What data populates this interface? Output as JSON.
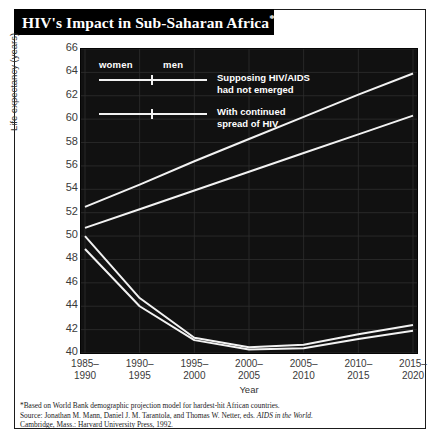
{
  "title": {
    "text": "HIV's Impact in Sub-Saharan Africa",
    "footnote_marker": "*"
  },
  "legend": {
    "col_women": "women",
    "col_men": "men",
    "series_a_label": "Supposing HIV/AIDS\nhad not emerged",
    "series_b_label": "With continued\nspread of HIV"
  },
  "notes": {
    "line1": "*Based on World Bank demographic projection model for hardest-hit African countries.",
    "line2_prefix": "Source: Jonathan M. Mann, Daniel J. M. Tarantola, and Thomas W. Netter, eds. ",
    "line2_italic": "AIDS in the World.",
    "line3": "Cambridge, Mass.: Harvard University Press, 1992."
  },
  "chart_data": {
    "type": "line",
    "title": "HIV's Impact in Sub-Saharan Africa",
    "xlabel": "Year",
    "ylabel": "Life expectancy (years)",
    "categories": [
      "1985–\n1990",
      "1990–\n1995",
      "1995–\n2000",
      "2000–\n2005",
      "2005–\n2010",
      "2010–\n2015",
      "2015–\n2020"
    ],
    "categories_flat": [
      "1985-1990",
      "1990-1995",
      "1995-2000",
      "2000-2005",
      "2005-2010",
      "2010-2015",
      "2015-2020"
    ],
    "ylim": [
      40,
      66
    ],
    "ytick_step": 2,
    "yticks": [
      66,
      64,
      62,
      60,
      58,
      56,
      54,
      52,
      50,
      48,
      46,
      44,
      42,
      40
    ],
    "grid": true,
    "legend_position": "top-left-inside",
    "line_color": "#f2f2f2",
    "plot_background": "#111111",
    "series": [
      {
        "name": "women, supposing HIV/AIDS had not emerged",
        "values": [
          52.5,
          54.4,
          56.4,
          58.3,
          60.2,
          62.1,
          63.9
        ]
      },
      {
        "name": "men, supposing HIV/AIDS had not emerged",
        "values": [
          50.7,
          52.3,
          53.9,
          55.5,
          57.1,
          58.7,
          60.3
        ]
      },
      {
        "name": "women, with continued spread of HIV",
        "values": [
          50.0,
          44.7,
          41.3,
          40.5,
          40.7,
          41.6,
          42.4
        ]
      },
      {
        "name": "men, with continued spread of HIV",
        "values": [
          48.9,
          44.0,
          41.1,
          40.3,
          40.4,
          41.2,
          41.9
        ]
      }
    ]
  }
}
